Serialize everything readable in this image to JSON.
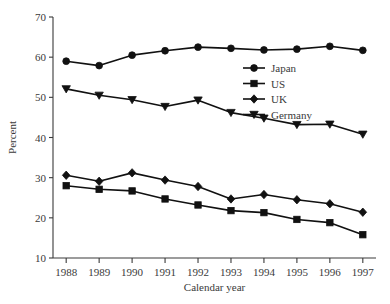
{
  "chart_data": {
    "type": "line",
    "title": "",
    "xlabel": "Calendar year",
    "ylabel": "Percent",
    "categories": [
      "1988",
      "1989",
      "1990",
      "1991",
      "1992",
      "1993",
      "1994",
      "1995",
      "1996",
      "1997"
    ],
    "x": [
      1988,
      1989,
      1990,
      1991,
      1992,
      1993,
      1994,
      1995,
      1996,
      1997
    ],
    "xlim": [
      1987.6,
      1997.4
    ],
    "ylim": [
      10,
      70
    ],
    "y_ticks": [
      10,
      20,
      30,
      40,
      50,
      60,
      70
    ],
    "y_tick_labels": [
      "10",
      "20",
      "30",
      "40",
      "50",
      "60",
      "70"
    ],
    "grid": false,
    "legend_position": "upper right",
    "series": [
      {
        "name": "Japan",
        "marker": "circle",
        "color": "#111111",
        "values": [
          59.0,
          57.9,
          60.5,
          61.6,
          62.5,
          62.2,
          61.8,
          62.0,
          62.7,
          61.7
        ]
      },
      {
        "name": "US",
        "marker": "square",
        "color": "#111111",
        "values": [
          28.0,
          27.1,
          26.7,
          24.7,
          23.2,
          21.8,
          21.3,
          19.6,
          18.8,
          15.8
        ]
      },
      {
        "name": "UK",
        "marker": "diamond",
        "color": "#111111",
        "values": [
          30.6,
          29.1,
          31.2,
          29.4,
          27.8,
          24.7,
          25.8,
          24.5,
          23.5,
          21.4
        ]
      },
      {
        "name": "Germany",
        "marker": "triangle-down",
        "color": "#111111",
        "values": [
          52.1,
          50.5,
          49.4,
          47.7,
          49.3,
          46.2,
          44.8,
          43.2,
          43.3,
          40.8
        ]
      }
    ]
  },
  "legend": {
    "entries": [
      {
        "label": "Japan"
      },
      {
        "label": "US"
      },
      {
        "label": "UK"
      },
      {
        "label": "Germany"
      }
    ]
  },
  "axes": {
    "y_title": "Percent",
    "x_title": "Calendar year"
  }
}
